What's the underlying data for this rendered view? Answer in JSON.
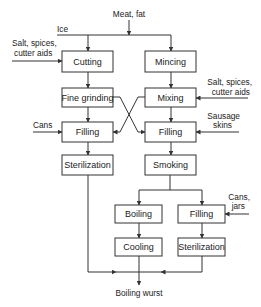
{
  "diagram": {
    "inputs": {
      "meat_fat": "Meat, fat",
      "ice": "Ice",
      "salt_left_line1": "Salt, spices,",
      "salt_left_line2": "cutter aids",
      "salt_right_line1": "Salt, spices,",
      "salt_right_line2": "cutter aids",
      "cans": "Cans",
      "sausage_line1": "Sausage",
      "sausage_line2": "skins",
      "cans_jars_line1": "Cans,",
      "cans_jars_line2": "jars"
    },
    "steps": {
      "cutting": "Cutting",
      "mincing": "Mincing",
      "fine_grinding": "Fine grinding",
      "mixing": "Mixing",
      "filling_left": "Filling",
      "filling_right": "Filling",
      "sterilization_left": "Sterilization",
      "smoking": "Smoking",
      "boiling": "Boiling",
      "filling_bottom": "Filling",
      "cooling": "Cooling",
      "sterilization_bottom": "Sterilization"
    },
    "output": "Boiling wurst"
  }
}
